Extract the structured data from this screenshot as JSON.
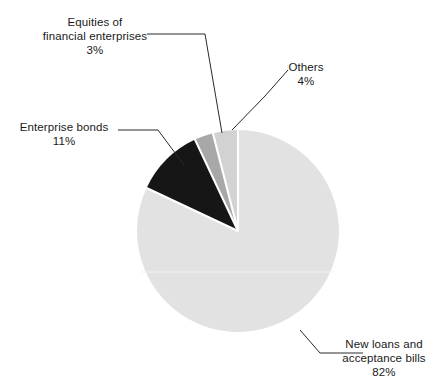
{
  "chart_data": {
    "type": "pie",
    "title": "",
    "subtitle": "",
    "xlabel": "",
    "ylabel": "",
    "legend_position": "none",
    "grid": false,
    "value_unit": "%",
    "start_angle_deg": 0,
    "direction": "clockwise",
    "categories": [
      "New loans and acceptance bills",
      "Enterprise bonds",
      "Equities of financial enterprises",
      "Others"
    ],
    "values": [
      82,
      11,
      3,
      4
    ],
    "slices": [
      {
        "key": "new-loans",
        "label_lines": [
          "New loans and",
          "acceptance bills",
          "82%"
        ],
        "value": 82,
        "value_text": "82%",
        "color": "#e2e2e2",
        "start_deg": 0,
        "end_deg": 295.2
      },
      {
        "key": "enterprise-bonds",
        "label_lines": [
          "Enterprise bonds",
          "11%"
        ],
        "value": 11,
        "value_text": "11%",
        "color": "#161616",
        "start_deg": 295.2,
        "end_deg": 334.8
      },
      {
        "key": "equities",
        "label_lines": [
          "Equities of",
          "financial enterprises",
          "3%"
        ],
        "value": 3,
        "value_text": "3%",
        "color": "#a8a8a8",
        "start_deg": 334.8,
        "end_deg": 345.6
      },
      {
        "key": "others",
        "label_lines": [
          "Others",
          "4%"
        ],
        "value": 4,
        "value_text": "4%",
        "color": "#d2d2d2",
        "start_deg": 345.6,
        "end_deg": 360
      }
    ]
  },
  "labels": {
    "equities": {
      "line1": "Equities of",
      "line2": "financial enterprises",
      "line3": "3%"
    },
    "enterprise_bonds": {
      "line1": "Enterprise bonds",
      "line2": "11%"
    },
    "others": {
      "line1": "Others",
      "line2": "4%"
    },
    "new_loans": {
      "line1": "New loans and",
      "line2": "acceptance bills",
      "line3": "82%"
    }
  },
  "colors": {
    "background": "#ffffff",
    "text": "#1a1a1a",
    "leader_line": "#2a2a2a",
    "slice_new_loans": "#e2e2e2",
    "slice_enterprise_bonds": "#161616",
    "slice_equities": "#a8a8a8",
    "slice_others": "#d2d2d2",
    "slice_separator": "#ffffff"
  }
}
